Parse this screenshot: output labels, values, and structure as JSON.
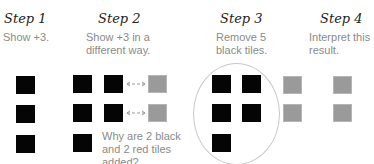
{
  "steps": [
    {
      "title": "Step 1",
      "description": "Show +3."
    },
    {
      "title": "Step 2",
      "description_line1": "Show +3 in a",
      "description_line2": "different way."
    },
    {
      "title": "Step 3",
      "description_line1": "Remove 5",
      "description_line2": "black tiles."
    },
    {
      "title": "Step 4",
      "description_line1": "Interpret this",
      "description_line2": "result."
    }
  ],
  "question": {
    "line1": "Why are 2 black",
    "line2": "and 2 red tiles",
    "line3": "added?"
  },
  "colors": {
    "black_tile": "#050505",
    "red_tile_rendered_gray": "#9a9a9a",
    "text": "#8a8a8a",
    "ellipse": "#c8c8c8"
  },
  "tiles": {
    "step1": {
      "black": 3
    },
    "step2": {
      "black": 5,
      "red": 2,
      "zero_pair_arrows": 2
    },
    "step3": {
      "black_circled": 5,
      "red": 2
    },
    "step4": {
      "red": 2
    }
  }
}
